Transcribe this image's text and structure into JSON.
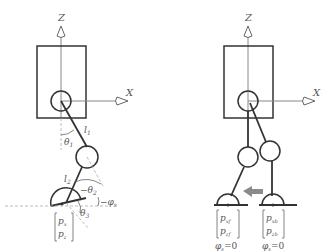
{
  "left_figure": {
    "axes": {
      "z_label": "Z",
      "x_label": "X"
    },
    "links": {
      "l1": "l",
      "l1_sub": "1",
      "l2": "l",
      "l2_sub": "2"
    },
    "angles": {
      "theta1": "θ",
      "theta1_sub": "1",
      "theta2_prefix": "−θ",
      "theta2_sub": "2",
      "theta3": "θ",
      "theta3_sub": "3",
      "phi_prefix": "−φ",
      "phi_sub": "s"
    },
    "foot_position": {
      "row1": "p",
      "row1_sub": "x",
      "row2": "p",
      "row2_sub": "z"
    }
  },
  "right_figure": {
    "axes": {
      "z_label": "Z",
      "x_label": "X"
    },
    "front_foot": {
      "row1": "p",
      "row1_sub": "xf",
      "row2": "p",
      "row2_sub": "zf",
      "phi": "φ",
      "phi_sub": "s",
      "phi_value": "=0"
    },
    "back_foot": {
      "row1": "p",
      "row1_sub": "xb",
      "row2": "p",
      "row2_sub": "zb",
      "phi": "φ",
      "phi_sub": "s",
      "phi_value": "=0"
    },
    "arrow": {
      "direction": "left",
      "color": "#8a8a8a"
    }
  },
  "colors": {
    "line": "#333333",
    "axis": "#888888",
    "dashed": "#aaaaaa",
    "text": "#555555"
  }
}
